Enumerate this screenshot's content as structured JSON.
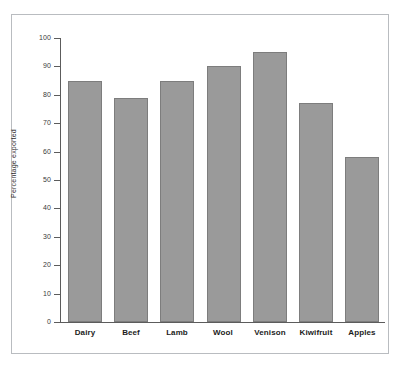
{
  "figure": {
    "frame_color": "#b9bcc0",
    "background": "#ffffff",
    "axis_color": "#5c5c5c",
    "bar_fill": "#9a9a9a",
    "bar_stroke": "#7d7d7d"
  },
  "chart_data": {
    "type": "bar",
    "title": "",
    "xlabel": "",
    "ylabel": "Percentage exported",
    "categories": [
      "Dairy",
      "Beef",
      "Lamb",
      "Wool",
      "Venison",
      "Kiwifruit",
      "Apples"
    ],
    "values": [
      85,
      79,
      85,
      90,
      95,
      77,
      58
    ],
    "ylim": [
      0,
      100
    ],
    "yticks": [
      0,
      10,
      20,
      30,
      40,
      50,
      60,
      70,
      80,
      90,
      100
    ],
    "ytick_labels": [
      "0",
      "10",
      "20",
      "30",
      "40",
      "50",
      "60",
      "70",
      "80",
      "90",
      "100"
    ],
    "grid": false,
    "legend": null
  }
}
